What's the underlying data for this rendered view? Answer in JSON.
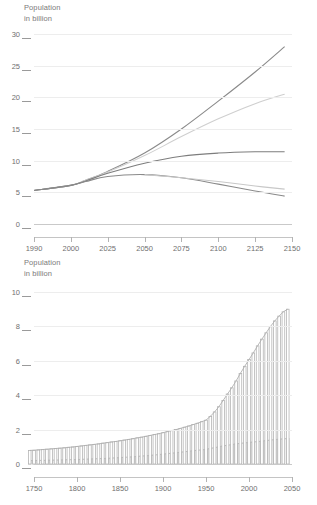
{
  "chart_data": [
    {
      "type": "line",
      "title": "Population\nin billion",
      "ylabel": "Population in billion",
      "xlabel": "",
      "xlim": [
        1990,
        2150
      ],
      "ylim": [
        0,
        30
      ],
      "xticks": [
        1990,
        2000,
        2025,
        2050,
        2075,
        2100,
        2125,
        2150
      ],
      "xtick_labels": [
        "1990",
        "2000",
        "2025",
        "2050",
        "2075",
        "2100",
        "2125",
        "2150"
      ],
      "yticks": [
        0,
        5,
        10,
        15,
        20,
        25,
        30
      ],
      "ytick_labels": [
        "0",
        "5",
        "10",
        "15",
        "20",
        "25",
        "30"
      ],
      "grid": true,
      "legend": "none",
      "series": [
        {
          "name": "high-variant",
          "color": "#8a8a8a",
          "x": [
            1990,
            2000,
            2010,
            2025,
            2050,
            2075,
            2100,
            2125,
            2145
          ],
          "values": [
            5.3,
            6.1,
            6.9,
            8.3,
            11.2,
            15.0,
            19.4,
            24.0,
            28.0
          ]
        },
        {
          "name": "medium-high-variant",
          "color": "#cfcfcf",
          "x": [
            1990,
            2000,
            2010,
            2025,
            2050,
            2075,
            2100,
            2125,
            2145
          ],
          "values": [
            5.3,
            6.1,
            6.9,
            8.2,
            10.8,
            13.8,
            16.6,
            19.0,
            20.5
          ]
        },
        {
          "name": "medium-variant",
          "color": "#7d7d7d",
          "x": [
            1990,
            2000,
            2010,
            2025,
            2050,
            2075,
            2100,
            2125,
            2145
          ],
          "values": [
            5.3,
            6.1,
            6.8,
            8.0,
            9.6,
            10.7,
            11.2,
            11.4,
            11.4
          ]
        },
        {
          "name": "low-variant",
          "color": "#8a8a8a",
          "x": [
            1990,
            2000,
            2010,
            2025,
            2050,
            2075,
            2100,
            2125,
            2145
          ],
          "values": [
            5.3,
            6.1,
            6.7,
            7.5,
            7.8,
            7.3,
            6.3,
            5.2,
            4.4
          ]
        },
        {
          "name": "constant-fertility-low",
          "color": "#c8c8c8",
          "x": [
            2050,
            2075,
            2100,
            2125,
            2145
          ],
          "values": [
            7.8,
            7.3,
            6.7,
            6.0,
            5.5
          ]
        }
      ]
    },
    {
      "type": "bar",
      "title": "Population\nin billion",
      "ylabel": "Population in billion",
      "xlabel": "",
      "xlim": [
        1740,
        2055
      ],
      "ylim": [
        0,
        10
      ],
      "xticks": [
        1750,
        1800,
        1850,
        1900,
        1950,
        2000,
        2050
      ],
      "xtick_labels": [
        "1750",
        "1800",
        "1850",
        "1900",
        "1950",
        "2000",
        "2050"
      ],
      "yticks": [
        0,
        2,
        4,
        6,
        8,
        10
      ],
      "ytick_labels": [
        "0",
        "2",
        "4",
        "6",
        "8",
        "10"
      ],
      "grid": true,
      "legend": "none",
      "bar_color": "#b9b9b9",
      "bar_step": 5,
      "series": [
        {
          "name": "world-population",
          "color": "#b0b0b0",
          "x": [
            1745,
            1750,
            1755,
            1760,
            1765,
            1770,
            1775,
            1780,
            1785,
            1790,
            1795,
            1800,
            1805,
            1810,
            1815,
            1820,
            1825,
            1830,
            1835,
            1840,
            1845,
            1850,
            1855,
            1860,
            1865,
            1870,
            1875,
            1880,
            1885,
            1890,
            1895,
            1900,
            1905,
            1910,
            1915,
            1920,
            1925,
            1930,
            1935,
            1940,
            1945,
            1950,
            1955,
            1960,
            1965,
            1970,
            1975,
            1980,
            1985,
            1990,
            1995,
            2000,
            2005,
            2010,
            2015,
            2020,
            2025,
            2030,
            2035,
            2040,
            2045
          ],
          "values": [
            0.79,
            0.8,
            0.82,
            0.84,
            0.86,
            0.88,
            0.9,
            0.92,
            0.94,
            0.97,
            0.99,
            1.02,
            1.05,
            1.08,
            1.11,
            1.14,
            1.17,
            1.21,
            1.24,
            1.28,
            1.31,
            1.35,
            1.39,
            1.43,
            1.47,
            1.52,
            1.56,
            1.61,
            1.66,
            1.71,
            1.76,
            1.82,
            1.88,
            1.94,
            2.0,
            2.07,
            2.14,
            2.21,
            2.29,
            2.37,
            2.46,
            2.55,
            2.77,
            3.03,
            3.33,
            3.7,
            4.07,
            4.43,
            4.83,
            5.27,
            5.68,
            6.07,
            6.46,
            6.87,
            7.26,
            7.63,
            8.0,
            8.32,
            8.6,
            8.85,
            9.0
          ],
          "color_fill": "#d2d2d2"
        },
        {
          "name": "industrialised-regions",
          "color": "#b9b9b9",
          "x": [
            1745,
            1750,
            1755,
            1760,
            1765,
            1770,
            1775,
            1780,
            1785,
            1790,
            1795,
            1800,
            1805,
            1810,
            1815,
            1820,
            1825,
            1830,
            1835,
            1840,
            1845,
            1850,
            1855,
            1860,
            1865,
            1870,
            1875,
            1880,
            1885,
            1890,
            1895,
            1900,
            1905,
            1910,
            1915,
            1920,
            1925,
            1930,
            1935,
            1940,
            1945,
            1950,
            1955,
            1960,
            1965,
            1970,
            1975,
            1980,
            1985,
            1990,
            1995,
            2000,
            2005,
            2010,
            2015,
            2020,
            2025,
            2030,
            2035,
            2040,
            2045
          ],
          "values": [
            0.2,
            0.2,
            0.21,
            0.21,
            0.22,
            0.22,
            0.23,
            0.23,
            0.24,
            0.25,
            0.25,
            0.26,
            0.27,
            0.28,
            0.29,
            0.3,
            0.31,
            0.32,
            0.33,
            0.34,
            0.36,
            0.37,
            0.39,
            0.4,
            0.42,
            0.44,
            0.46,
            0.48,
            0.5,
            0.52,
            0.55,
            0.57,
            0.6,
            0.63,
            0.65,
            0.68,
            0.71,
            0.74,
            0.77,
            0.8,
            0.82,
            0.85,
            0.9,
            0.95,
            1.0,
            1.05,
            1.09,
            1.13,
            1.17,
            1.2,
            1.23,
            1.25,
            1.28,
            1.3,
            1.33,
            1.36,
            1.39,
            1.42,
            1.44,
            1.46,
            1.48
          ]
        }
      ]
    }
  ],
  "top": {
    "title_line1": "Population",
    "title_line2": "in billion"
  },
  "bottom": {
    "title_line1": "Population",
    "title_line2": "in billion"
  }
}
